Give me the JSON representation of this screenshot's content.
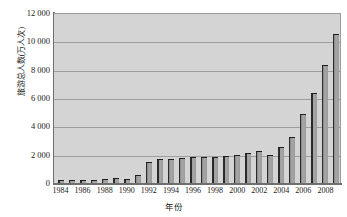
{
  "chart_data": {
    "type": "bar",
    "title": "",
    "xlabel": "年份",
    "ylabel": "旅游总人数(万人次)",
    "ylim": [
      0,
      12000
    ],
    "ytick_labels": [
      "12 000",
      "10 000",
      "8 000",
      "6 000",
      "4 000",
      "2 000",
      "0"
    ],
    "ytick_values": [
      12000,
      10000,
      8000,
      6000,
      4000,
      2000,
      0
    ],
    "grid": true,
    "legend": "none",
    "categories": [
      "1984",
      "1985",
      "1986",
      "1987",
      "1988",
      "1989",
      "1990",
      "1991",
      "1992",
      "1993",
      "1994",
      "1995",
      "1996",
      "1997",
      "1998",
      "1999",
      "2000",
      "2001",
      "2002",
      "2003",
      "2004",
      "2005",
      "2006",
      "2007",
      "2008",
      "2009"
    ],
    "xtick_labels": [
      "1984",
      "1986",
      "1988",
      "1990",
      "1992",
      "1994",
      "1996",
      "1998",
      "2000",
      "2002",
      "2004",
      "2006",
      "2008"
    ],
    "values": [
      200,
      220,
      240,
      230,
      250,
      330,
      250,
      560,
      1500,
      1700,
      1680,
      1750,
      1820,
      1830,
      1840,
      1900,
      2000,
      2100,
      2260,
      1990,
      2550,
      3230,
      4850,
      6330,
      8300,
      10550
    ],
    "series_color": "#9a9a9a",
    "plot_bg_color": "#d4d4d4",
    "gridline_color": "#9d9d9d",
    "axis_color": "#6f6f6f"
  }
}
